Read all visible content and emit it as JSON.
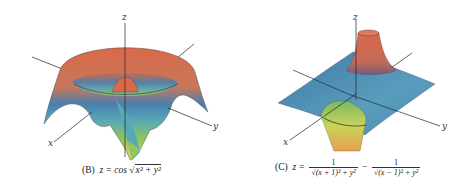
{
  "figures": [
    {
      "id": "B",
      "label": "(B)",
      "equation_lhs": "z = cos",
      "equation_radicand": "x² + y²",
      "axes": {
        "x": "x",
        "y": "y",
        "z": "z"
      },
      "surface_colors": [
        "#d9694a",
        "#c87a5a",
        "#4a7fae",
        "#55a6b8",
        "#8fc45a",
        "#e8d75a"
      ]
    },
    {
      "id": "C",
      "label": "(C)",
      "equation_lhs": "z =",
      "term1_numerator": "1",
      "term1_denominator": "√(x + 1)² + y²",
      "operator": "−",
      "term2_numerator": "1",
      "term2_denominator": "√(x − 1)² + y²",
      "axes": {
        "x": "x",
        "y": "y",
        "z": "z"
      },
      "surface_colors": [
        "#d9694a",
        "#4f86b4",
        "#5fa0b8",
        "#9cc856",
        "#e8c45a"
      ]
    }
  ]
}
